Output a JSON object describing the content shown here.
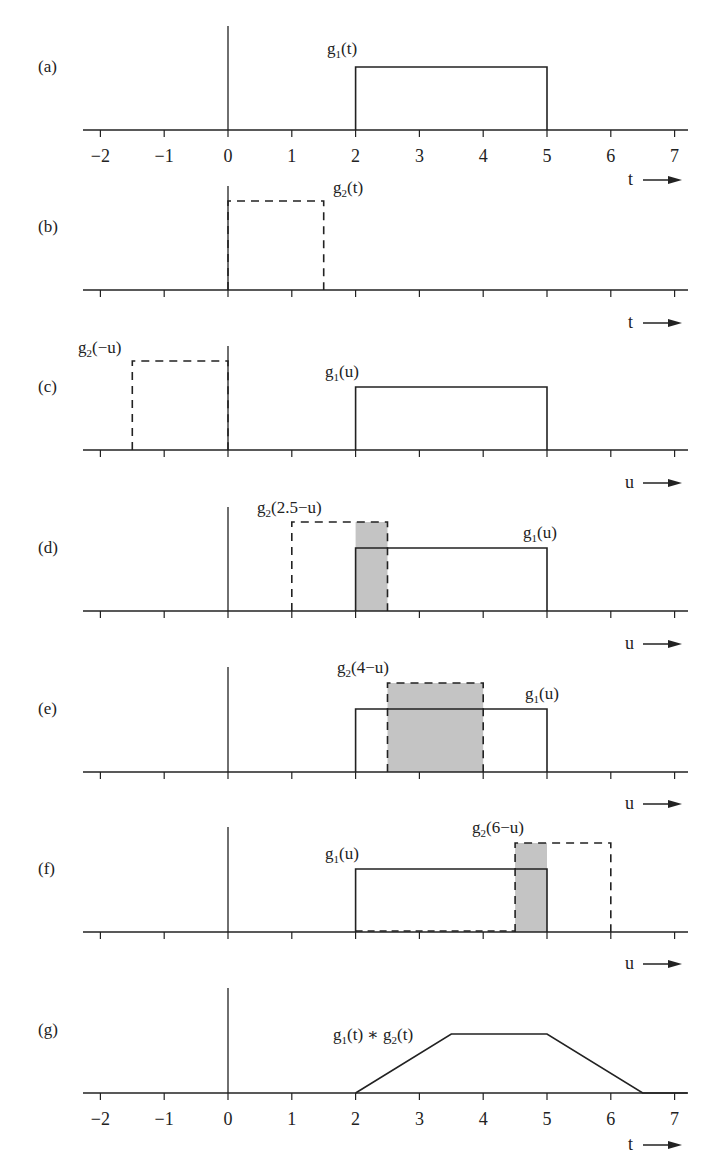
{
  "figure": {
    "colors": {
      "ink": "#222222",
      "shade": "#c4c4c4",
      "background": "#ffffff"
    },
    "scale": {
      "x0_px": 228,
      "px_per_unit": 63.8,
      "axis_left_px": 83,
      "axis_right_px": 688,
      "pulse_height_tall": 89,
      "pulse_height_short": 63
    },
    "tick_values": [
      -2,
      -1,
      0,
      1,
      2,
      3,
      4,
      5,
      6,
      7
    ],
    "panels": [
      {
        "id": "a",
        "label": "(a)",
        "baseline": 130,
        "vaxis_top": 26,
        "show_tick_labels": true,
        "axis_var": "t",
        "rects": [
          {
            "name": "g1-pulse",
            "from": 2,
            "to": 5,
            "height": 63,
            "style": "solid"
          }
        ],
        "shades": [],
        "texts": [
          {
            "name": "g1-label",
            "main": "g",
            "sub": "1",
            "rest": "(t)",
            "x": 327,
            "y": 54
          }
        ]
      },
      {
        "id": "b",
        "label": "(b)",
        "baseline": 290,
        "vaxis_top": 186,
        "show_tick_labels": false,
        "axis_var": "t",
        "rects": [
          {
            "name": "g2-pulse",
            "from": 0,
            "to": 1.5,
            "height": 89,
            "style": "dashed"
          }
        ],
        "shades": [],
        "texts": [
          {
            "name": "g2-label",
            "main": "g",
            "sub": "2",
            "rest": "(t)",
            "x": 333,
            "y": 193
          }
        ]
      },
      {
        "id": "c",
        "label": "(c)",
        "baseline": 450,
        "vaxis_top": 346,
        "show_tick_labels": false,
        "axis_var": "u",
        "rects": [
          {
            "name": "g2-reversed-pulse",
            "from": -1.5,
            "to": 0,
            "height": 89,
            "style": "dashed"
          },
          {
            "name": "g1-pulse",
            "from": 2,
            "to": 5,
            "height": 63,
            "style": "solid"
          }
        ],
        "shades": [],
        "texts": [
          {
            "name": "g2-reversed-label",
            "main": "g",
            "sub": "2",
            "rest": "(−u)",
            "x": 78,
            "y": 353
          },
          {
            "name": "g1-label",
            "main": "g",
            "sub": "1",
            "rest": "(u)",
            "x": 325,
            "y": 377
          }
        ]
      },
      {
        "id": "d",
        "label": "(d)",
        "baseline": 611,
        "vaxis_top": 507,
        "show_tick_labels": false,
        "axis_var": "u",
        "rects": [
          {
            "name": "g2-shifted-pulse",
            "from": 1,
            "to": 2.5,
            "height": 89,
            "style": "dashed"
          },
          {
            "name": "g1-pulse",
            "from": 2,
            "to": 5,
            "height": 63,
            "style": "solid"
          }
        ],
        "shades": [
          {
            "name": "overlap-area",
            "from": 2,
            "to": 2.5,
            "height": 89
          }
        ],
        "texts": [
          {
            "name": "g2-shifted-label",
            "main": "g",
            "sub": "2",
            "rest": "(2.5−u)",
            "x": 257,
            "y": 513
          },
          {
            "name": "g1-label",
            "main": "g",
            "sub": "1",
            "rest": "(u)",
            "x": 523,
            "y": 538
          }
        ]
      },
      {
        "id": "e",
        "label": "(e)",
        "baseline": 772,
        "vaxis_top": 667,
        "show_tick_labels": false,
        "axis_var": "u",
        "rects": [
          {
            "name": "g1-pulse",
            "from": 2,
            "to": 5,
            "height": 63,
            "style": "solid"
          },
          {
            "name": "g2-shifted-pulse",
            "from": 2.5,
            "to": 4,
            "height": 89,
            "style": "dashed"
          }
        ],
        "shades": [
          {
            "name": "overlap-area",
            "from": 2.5,
            "to": 4,
            "height": 89
          }
        ],
        "texts": [
          {
            "name": "g2-shifted-label",
            "main": "g",
            "sub": "2",
            "rest": "(4−u)",
            "x": 337,
            "y": 673
          },
          {
            "name": "g1-label",
            "main": "g",
            "sub": "1",
            "rest": "(u)",
            "x": 525,
            "y": 699
          }
        ]
      },
      {
        "id": "f",
        "label": "(f)",
        "baseline": 932,
        "vaxis_top": 827,
        "show_tick_labels": false,
        "axis_var": "u",
        "rects": [
          {
            "name": "g1-pulse",
            "from": 2,
            "to": 5,
            "height": 63,
            "style": "solid"
          },
          {
            "name": "g2-shifted-pulse",
            "from": 4.5,
            "to": 6,
            "height": 89,
            "style": "dashed"
          }
        ],
        "shades": [
          {
            "name": "overlap-area",
            "from": 4.5,
            "to": 5,
            "height": 89
          }
        ],
        "texts": [
          {
            "name": "g2-shifted-label",
            "main": "g",
            "sub": "2",
            "rest": "(6−u)",
            "x": 472,
            "y": 833
          },
          {
            "name": "g1-label",
            "main": "g",
            "sub": "1",
            "rest": "(u)",
            "x": 325,
            "y": 859
          }
        ],
        "extra_dashed_baseline": {
          "from": 2,
          "to": 4.5
        }
      },
      {
        "id": "g",
        "label": "(g)",
        "baseline": 1093,
        "vaxis_top": 988,
        "show_tick_labels": true,
        "axis_var": "t",
        "rects": [],
        "shades": [],
        "polyline": {
          "name": "convolution-result",
          "points": [
            [
              2,
              0
            ],
            [
              3.5,
              59
            ],
            [
              5,
              59
            ],
            [
              6.5,
              0
            ],
            [
              7.2,
              0
            ]
          ]
        },
        "texts": [
          {
            "name": "convolution-label",
            "expr": [
              [
                "g",
                "1",
                "(t) ∗ "
              ],
              [
                "g",
                "2",
                "(t)"
              ]
            ],
            "x": 333,
            "y": 1040
          }
        ]
      }
    ],
    "axis_arrows": [
      {
        "after_panel": "a",
        "var": "t",
        "y": 180
      },
      {
        "after_panel": "b",
        "var": "t",
        "y": 323
      },
      {
        "after_panel": "c",
        "var": "u",
        "y": 483
      },
      {
        "after_panel": "d",
        "var": "u",
        "y": 644
      },
      {
        "after_panel": "e",
        "var": "u",
        "y": 804
      },
      {
        "after_panel": "f",
        "var": "u",
        "y": 964
      },
      {
        "after_panel": "g",
        "var": "t",
        "y": 1145
      }
    ]
  },
  "chart_data": {
    "type": "diagram",
    "xlabel": "t / u",
    "x_range": [
      -2,
      7
    ],
    "tick_labels": [
      "−2",
      "−1",
      "0",
      "1",
      "2",
      "3",
      "4",
      "5",
      "6",
      "7"
    ],
    "panels": [
      {
        "label": "(a)",
        "series": [
          {
            "name": "g1(t)",
            "type": "rect",
            "x": [
              2,
              5
            ],
            "style": "solid"
          }
        ]
      },
      {
        "label": "(b)",
        "series": [
          {
            "name": "g2(t)",
            "type": "rect",
            "x": [
              0,
              1.5
            ],
            "style": "dashed"
          }
        ]
      },
      {
        "label": "(c)",
        "series": [
          {
            "name": "g2(−u)",
            "type": "rect",
            "x": [
              -1.5,
              0
            ],
            "style": "dashed"
          },
          {
            "name": "g1(u)",
            "type": "rect",
            "x": [
              2,
              5
            ],
            "style": "solid"
          }
        ]
      },
      {
        "label": "(d)",
        "series": [
          {
            "name": "g2(2.5−u)",
            "type": "rect",
            "x": [
              1,
              2.5
            ],
            "style": "dashed"
          },
          {
            "name": "g1(u)",
            "type": "rect",
            "x": [
              2,
              5
            ],
            "style": "solid"
          }
        ],
        "shaded_overlap": [
          2,
          2.5
        ]
      },
      {
        "label": "(e)",
        "series": [
          {
            "name": "g2(4−u)",
            "type": "rect",
            "x": [
              2.5,
              4
            ],
            "style": "dashed"
          },
          {
            "name": "g1(u)",
            "type": "rect",
            "x": [
              2,
              5
            ],
            "style": "solid"
          }
        ],
        "shaded_overlap": [
          2.5,
          4
        ]
      },
      {
        "label": "(f)",
        "series": [
          {
            "name": "g2(6−u)",
            "type": "rect",
            "x": [
              4.5,
              6
            ],
            "style": "dashed"
          },
          {
            "name": "g1(u)",
            "type": "rect",
            "x": [
              2,
              5
            ],
            "style": "solid"
          }
        ],
        "shaded_overlap": [
          4.5,
          5
        ]
      },
      {
        "label": "(g)",
        "series": [
          {
            "name": "g1(t) ∗ g2(t)",
            "type": "line",
            "x": [
              2,
              3.5,
              5,
              6.5,
              7
            ],
            "y": [
              0,
              1,
              1,
              0,
              0
            ]
          }
        ]
      }
    ]
  }
}
